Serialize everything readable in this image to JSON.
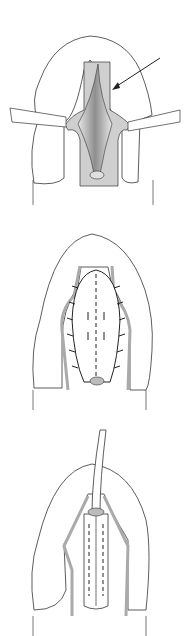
{
  "figure": {
    "panels": [
      {
        "id": "panel-1",
        "description": "incision retracted, arrow pointing to tissue edge",
        "elements": [
          "retractor-left",
          "retractor-right",
          "arrow",
          "central-groove",
          "meatus"
        ]
      },
      {
        "id": "panel-2",
        "description": "sutured closure with interrupted sutures",
        "elements": [
          "suture-line-left",
          "suture-line-right",
          "dashed-midline",
          "meatus"
        ]
      },
      {
        "id": "panel-3",
        "description": "catheter in place, closure completed",
        "elements": [
          "catheter",
          "dashed-suture-rows",
          "midline"
        ]
      }
    ],
    "colors": {
      "outline": "#333333",
      "skin": "#ffffff",
      "shading_light": "#d8d8d8",
      "shading_mid": "#bdbdbd",
      "shading_dark": "#8c8c8c",
      "suture": "#222222"
    }
  }
}
